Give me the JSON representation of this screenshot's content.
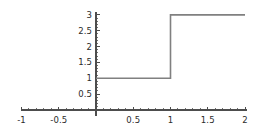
{
  "chart_data": {
    "type": "line",
    "title": "",
    "xlabel": "",
    "ylabel": "",
    "xlim": [
      -1,
      2
    ],
    "ylim": [
      0,
      3
    ],
    "grid": false,
    "legend": null,
    "xticks": [
      -1,
      -0.5,
      0,
      0.5,
      1,
      1.5,
      2
    ],
    "xtick_labels": [
      "-1",
      "-0.5",
      "",
      "0.5",
      "1",
      "1.5",
      "2"
    ],
    "yticks": [
      0.5,
      1,
      1.5,
      2,
      2.5,
      3
    ],
    "ytick_labels": [
      "0.5",
      "1",
      "1.5",
      "2",
      "2.5",
      "3"
    ],
    "minor_tick_step_x": 0.1,
    "minor_tick_step_y": 0.1,
    "series": [
      {
        "name": "step",
        "x": [
          0,
          1,
          1,
          2
        ],
        "values": [
          1,
          1,
          3,
          3
        ]
      }
    ],
    "steps": [
      {
        "x_start": 0,
        "x_end": 1,
        "y": 1
      },
      {
        "x_start": 1,
        "x_end": 2,
        "y": 3
      }
    ],
    "jump": {
      "x": 1,
      "y_from": 1,
      "y_to": 3
    }
  },
  "style": {
    "line_color": "#808080",
    "axis_color": "#4d4d4d",
    "tick_color": "#4d4d4d",
    "label_color": "#2b2b2b",
    "background": "#ffffff"
  }
}
